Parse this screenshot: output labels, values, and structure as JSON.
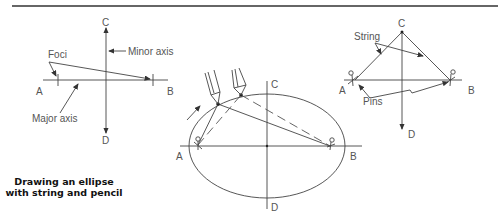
{
  "title": {
    "line1": "Drawing an ellipse",
    "line2": "with string and pencil"
  },
  "figure1": {
    "point_labels": {
      "A": "A",
      "B": "B",
      "C": "C",
      "D": "D"
    },
    "annotations": {
      "foci": "Foci",
      "minor_axis": "Minor axis",
      "major_axis": "Major axis"
    }
  },
  "figure2": {
    "point_labels": {
      "A": "A",
      "B": "B",
      "C": "C",
      "D": "D"
    }
  },
  "figure3": {
    "point_labels": {
      "A": "A",
      "B": "B",
      "C": "C",
      "D": "D"
    },
    "annotations": {
      "string": "String",
      "pins": "Pins"
    }
  },
  "colors": {
    "line": "#444444",
    "text": "#555555",
    "title": "#111111"
  }
}
